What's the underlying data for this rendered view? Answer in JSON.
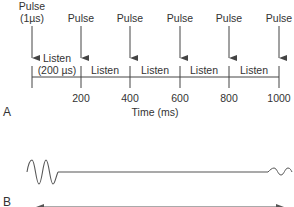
{
  "panel_a": {
    "label": "A",
    "axis_title": "Time (ms)",
    "pulses": [
      {
        "line1": "Pulse",
        "line2": "(1µs)",
        "x": 32
      },
      {
        "line1": "Pulse",
        "x": 81
      },
      {
        "line1": "Pulse",
        "x": 130
      },
      {
        "line1": "Pulse",
        "x": 180
      },
      {
        "line1": "Pulse",
        "x": 229
      },
      {
        "line1": "Pulse",
        "x": 279
      }
    ],
    "listen": [
      {
        "line1": "Listen",
        "line2": "(200 µs)"
      },
      {
        "line1": "Listen"
      },
      {
        "line1": "Listen"
      },
      {
        "line1": "Listen"
      },
      {
        "line1": "Listen"
      }
    ],
    "ticks": [
      "200",
      "400",
      "600",
      "800",
      "1000"
    ]
  },
  "panel_b": {
    "label": "B",
    "description": "Transmitted pulse waveform followed by long listening period and small returning echo"
  },
  "colors": {
    "line": "#444444",
    "text": "#333333",
    "background": "#ffffff"
  }
}
